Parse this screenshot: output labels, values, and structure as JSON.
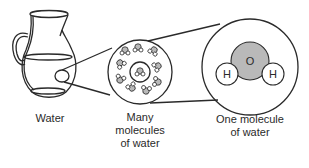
{
  "diagram": {
    "type": "zoom-in illustration",
    "stages": [
      {
        "id": "pitcher",
        "label_lines": [
          "Water"
        ]
      },
      {
        "id": "many-molecules",
        "label_lines": [
          "Many",
          "molecules",
          "of water"
        ]
      },
      {
        "id": "one-molecule",
        "label_lines": [
          "One molecule",
          "of water"
        ]
      }
    ],
    "molecule": {
      "center_atom": "O",
      "side_atoms": [
        "H",
        "H"
      ]
    },
    "colors": {
      "outline": "#2a2a2a",
      "oxygen_fill": "#b9b9b9",
      "background": "#ffffff"
    }
  }
}
